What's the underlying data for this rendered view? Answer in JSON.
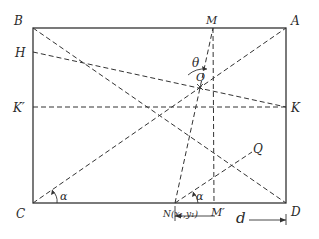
{
  "figure": {
    "rectangle": {
      "x": 33,
      "y": 28,
      "width": 253,
      "height": 175
    },
    "points": {
      "B": {
        "label": "B",
        "x": 33,
        "y": 28,
        "lx": 14,
        "ly": 25
      },
      "A": {
        "label": "A",
        "x": 286,
        "y": 28,
        "lx": 291,
        "ly": 25
      },
      "C": {
        "label": "C",
        "x": 33,
        "y": 203,
        "lx": 16,
        "ly": 218
      },
      "D": {
        "label": "D",
        "x": 286,
        "y": 203,
        "lx": 291,
        "ly": 216
      },
      "M": {
        "label": "M",
        "x": 213,
        "y": 28,
        "lx": 206,
        "ly": 24
      },
      "M_prime": {
        "label": "M′",
        "x": 214,
        "y": 203,
        "lx": 211,
        "ly": 216
      },
      "H": {
        "label": "H",
        "x": 33,
        "y": 52,
        "lx": 15,
        "ly": 57
      },
      "K_prime": {
        "label": "K′",
        "x": 33,
        "y": 107,
        "lx": 13,
        "ly": 112
      },
      "K": {
        "label": "K",
        "x": 286,
        "y": 107,
        "lx": 291,
        "ly": 112
      },
      "O": {
        "label": "O",
        "x": 200,
        "y": 87,
        "lx": 196,
        "ly": 81
      },
      "Q": {
        "label": "Q",
        "x": 252,
        "y": 152,
        "lx": 253,
        "ly": 153
      },
      "N": {
        "label": "N(x₁,y₁)",
        "x": 175,
        "y": 203,
        "lx": 163,
        "ly": 217
      }
    },
    "angles": {
      "theta": {
        "label": "θ",
        "lx": 192,
        "ly": 67
      },
      "alpha_C": {
        "label": "α",
        "lx": 60,
        "ly": 200
      },
      "alpha_N": {
        "label": "α",
        "lx": 196,
        "ly": 200
      }
    },
    "distance": {
      "label": "d",
      "lx": 236,
      "ly": 223
    }
  }
}
